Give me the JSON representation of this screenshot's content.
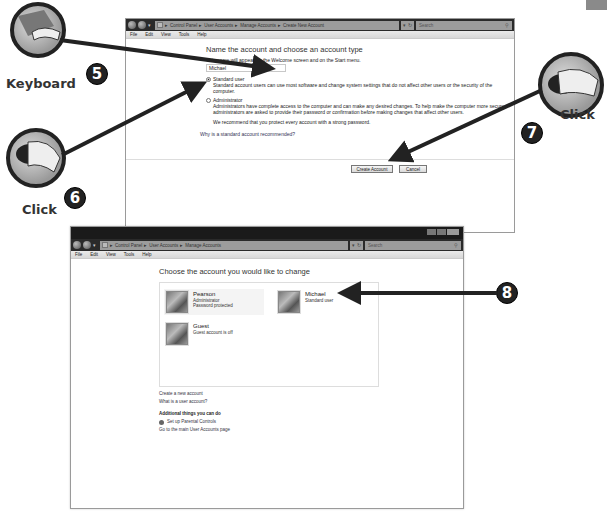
{
  "top_window": {
    "breadcrumb": [
      "Control Panel",
      "User Accounts",
      "Manage Accounts",
      "Create New Account"
    ],
    "search_placeholder": "Search",
    "menu": [
      "File",
      "Edit",
      "View",
      "Tools",
      "Help"
    ],
    "title": "Name the account and choose an account type",
    "hint": "This name will appear on the Welcome screen and on the Start menu.",
    "name_value": "Michael",
    "options": [
      {
        "label": "Standard user",
        "checked": true,
        "desc": "Standard account users can use most software and change system settings that do not affect other users or the security of the computer."
      },
      {
        "label": "Administrator",
        "checked": false,
        "desc": "Administrators have complete access to the computer and can make any desired changes. To help make the computer more secure, administrators are asked to provide their password or confirmation before making changes that affect other users."
      }
    ],
    "recommend": "We recommend that you protect every account with a strong password.",
    "why_link": "Why is a standard account recommended?",
    "create_button": "Create Account",
    "cancel_button": "Cancel"
  },
  "bottom_window": {
    "breadcrumb": [
      "Control Panel",
      "User Accounts",
      "Manage Accounts"
    ],
    "search_placeholder": "Search",
    "menu": [
      "File",
      "Edit",
      "View",
      "Tools",
      "Help"
    ],
    "title": "Choose the account you would like to change",
    "accounts": [
      {
        "name": "Pearson",
        "lines": [
          "Administrator",
          "Password protected"
        ]
      },
      {
        "name": "Michael",
        "lines": [
          "Standard user"
        ]
      },
      {
        "name": "Guest",
        "lines": [
          "Guest account is off"
        ]
      }
    ],
    "create_link": "Create a new account",
    "what_link": "What is a user account?",
    "additional_heading": "Additional things you can do",
    "parental_link": "Set up Parental Controls",
    "main_page_link": "Go to the main User Accounts page"
  },
  "callouts": [
    {
      "step": "5",
      "label": "Keyboard",
      "icon": "keyboard-icon"
    },
    {
      "step": "6",
      "label": "Click",
      "icon": "mouse-click-icon"
    },
    {
      "step": "7",
      "label": "Click",
      "icon": "mouse-click-icon"
    },
    {
      "step": "8",
      "label": ""
    }
  ]
}
